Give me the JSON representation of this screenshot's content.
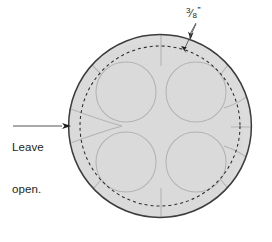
{
  "diagram": {
    "canvas": {
      "width": 272,
      "height": 242,
      "background": "#ffffff"
    },
    "colors": {
      "outer_circle_stroke": "#3a3a3a",
      "fill": "#dddddd",
      "dashed_stitch_line": "#2b2b2b",
      "petal_outline": "#b5b5b5",
      "label_text": "#231f20",
      "leader_line": "#5a5a5a"
    },
    "labels": [
      {
        "name": "leave-open-label",
        "lines": [
          "Leave",
          "open."
        ],
        "text": "Leave open.",
        "position": "left",
        "has_leader_arrow": true
      },
      {
        "name": "seam-allowance-label",
        "numerator": "3",
        "slash": "⁄",
        "denominator": "8",
        "unit": "”",
        "text": "3/8”",
        "position": "top-right",
        "has_leader_arrow": true,
        "arrow_count": 2
      }
    ],
    "shapes": {
      "outer_circle": {
        "name": "fabric-circle",
        "cx": 160,
        "cy": 126,
        "r": 92,
        "stroke_width": 1.4,
        "style": "solid"
      },
      "stitch_circle": {
        "name": "stitch-line-circle",
        "cx": 160,
        "cy": 126,
        "r": 80,
        "stroke_width": 1.1,
        "style": "dashed",
        "dash_pattern": "3,3"
      },
      "petals": [
        {
          "name": "petal-top-left",
          "cx": 126,
          "cy": 92,
          "r": 30
        },
        {
          "name": "petal-top-right",
          "cx": 196,
          "cy": 92,
          "r": 30
        },
        {
          "name": "petal-bottom-left",
          "cx": 126,
          "cy": 162,
          "r": 30
        },
        {
          "name": "petal-bottom-right",
          "cx": 196,
          "cy": 162,
          "r": 30
        }
      ],
      "opening_notch": {
        "name": "leave-open-notch",
        "description": "V-shaped gap at the left edge of the circle",
        "tip_x": 122,
        "y": 126
      }
    }
  }
}
